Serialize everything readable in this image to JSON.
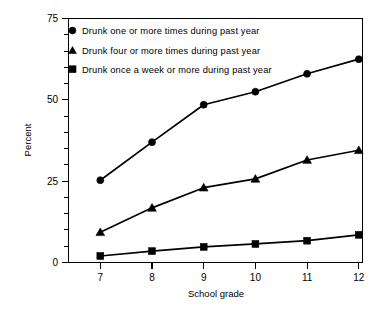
{
  "chart_data": {
    "type": "line",
    "title": "",
    "subtitle": "",
    "xlabel": "School grade",
    "ylabel": "Percent",
    "categories": [
      "7",
      "8",
      "9",
      "10",
      "11",
      "12"
    ],
    "x": [
      7,
      8,
      9,
      10,
      11,
      12
    ],
    "xlim": [
      6.6,
      12.3
    ],
    "ylim": [
      0,
      75
    ],
    "y_ticks_major": [
      "0",
      "25",
      "50",
      "75"
    ],
    "y_ticks_major_values": [
      0,
      25,
      50,
      75
    ],
    "y_ticks_minor_values": [
      5,
      10,
      15,
      20,
      30,
      35,
      40,
      45,
      55,
      60,
      65,
      70
    ],
    "grid": false,
    "legend_position": "top-left-inside",
    "series": [
      {
        "name": "Drunk one or more times during past year",
        "marker": "circle",
        "values": [
          25.3,
          37.0,
          48.5,
          52.5,
          58.0,
          62.5
        ]
      },
      {
        "name": "Drunk four or more times during past year",
        "marker": "triangle",
        "values": [
          9.3,
          16.8,
          23.0,
          25.7,
          31.5,
          34.5
        ]
      },
      {
        "name": "Drunk once a week or more during past year",
        "marker": "square",
        "values": [
          2.0,
          3.5,
          4.8,
          5.7,
          6.7,
          8.5
        ]
      }
    ],
    "colors": {
      "line": "#000000",
      "marker": "#000000",
      "axis": "#000000",
      "background": "#ffffff"
    }
  },
  "legend": {
    "entries": [
      {
        "marker": "circle-marker-icon",
        "label": "Drunk one or more times during past year"
      },
      {
        "marker": "triangle-marker-icon",
        "label": "Drunk four or more times during past year"
      },
      {
        "marker": "square-marker-icon",
        "label": "Drunk once a week or more during past year"
      }
    ]
  }
}
